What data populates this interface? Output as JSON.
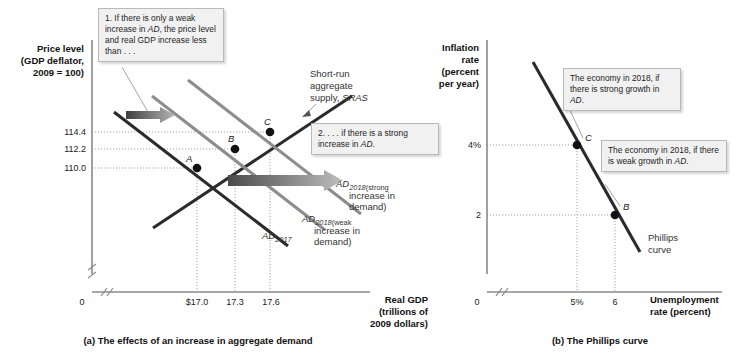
{
  "panel_a": {
    "caption": "(a) The effects of an increase in aggregate demand",
    "y_axis_title_lines": [
      "Price level",
      "(GDP deflator,",
      "2009 = 100)"
    ],
    "x_axis_title_lines": [
      "Real GDP",
      "(trillions of",
      "2009 dollars)"
    ],
    "origin_label": "0",
    "y_ticks": [
      "114.4",
      "112.2",
      "110.0"
    ],
    "x_ticks": [
      "$17.0",
      "17.3",
      "17.6"
    ],
    "sras_label_lines": [
      "Short-run",
      "aggregate",
      "supply, SRAS"
    ],
    "sras_label_italic": "SRAS",
    "points": [
      {
        "name": "A",
        "x_value": "$17.0",
        "y_value": "110.0"
      },
      {
        "name": "B",
        "x_value": "17.3",
        "y_value": "112.2"
      },
      {
        "name": "C",
        "x_value": "17.6",
        "y_value": "114.4"
      }
    ],
    "curve_labels": {
      "ad2017": "AD",
      "ad2017_sub": "2017",
      "ad_strong": "AD",
      "ad_strong_sub": "2018",
      "ad_strong_note": [
        "(strong",
        "increase in",
        "demand)"
      ],
      "ad_weak": "AD",
      "ad_weak_sub": "2018",
      "ad_weak_note": [
        "(weak",
        "increase in",
        "demand)"
      ]
    },
    "callout_1": "1. If there is only a weak increase in AD, the price level and real GDP increase less than . . .",
    "callout_1_parts": {
      "before": "1. If there is only a weak increase in ",
      "italic": "AD",
      "after": ", the price level and real GDP increase less than . . ."
    },
    "callout_2_parts": {
      "before": "2. . . . if there is a strong increase in ",
      "italic": "AD",
      "after": "."
    }
  },
  "panel_b": {
    "caption": "(b) The Phillips curve",
    "y_axis_title_lines": [
      "Inflation",
      "rate",
      "(percent",
      "per year)"
    ],
    "x_axis_title_lines": [
      "Unemployment",
      "rate (percent)"
    ],
    "origin_label": "0",
    "y_ticks": [
      "4%",
      "2"
    ],
    "x_ticks": [
      "5%",
      "6"
    ],
    "curve_label_lines": [
      "Phillips",
      "curve"
    ],
    "points": [
      {
        "name": "C",
        "x_value": "5%",
        "y_value": "4%"
      },
      {
        "name": "B",
        "x_value": "6",
        "y_value": "2"
      }
    ],
    "callout_c_parts": {
      "before": "The economy in 2018, if there is strong growth in ",
      "italic": "AD",
      "after": "."
    },
    "callout_b_parts": {
      "before": "The economy in 2018, if there is weak growth in ",
      "italic": "AD",
      "after": "."
    }
  },
  "colors": {
    "curve_dark": "#2b2b2b",
    "curve_gray": "#8d8d8d",
    "axis": "#8a8a8a",
    "callout_bg": "#f1f1f1",
    "callout_border": "#b9b9b9",
    "background": "#ffffff"
  }
}
